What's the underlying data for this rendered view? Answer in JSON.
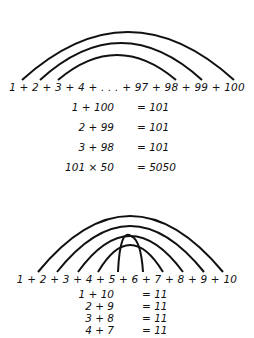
{
  "diagram_top": {
    "sequence": "1 + 2 + 3 + 4 + . . . + 97 + 98 + 99 + 100",
    "arc_pairs": [
      [
        "1",
        "100"
      ],
      [
        "2",
        "99"
      ],
      [
        "3",
        "98"
      ]
    ],
    "equations": [
      {
        "lhs": "1 + 100",
        "rhs": "= 101"
      },
      {
        "lhs": "2 + 99",
        "rhs": "= 101"
      },
      {
        "lhs": "3 + 98",
        "rhs": "= 101"
      },
      {
        "lhs": "101 × 50",
        "rhs": "= 5050"
      }
    ]
  },
  "diagram_bottom": {
    "sequence": "1 + 2 + 3 + 4 + 5 + 6 + 7 + 8 + 9 + 10",
    "arc_pairs": [
      [
        "1",
        "10"
      ],
      [
        "2",
        "9"
      ],
      [
        "3",
        "8"
      ],
      [
        "4",
        "7"
      ],
      [
        "5",
        "6"
      ]
    ],
    "equations": [
      {
        "lhs": "1 + 10",
        "rhs": "= 11"
      },
      {
        "lhs": "2 + 9",
        "rhs": "= 11"
      },
      {
        "lhs": "3 + 8",
        "rhs": "= 11"
      },
      {
        "lhs": "4 + 7",
        "rhs": "= 11"
      }
    ]
  },
  "colors": {
    "ink": "#111111",
    "background": "#ffffff"
  }
}
